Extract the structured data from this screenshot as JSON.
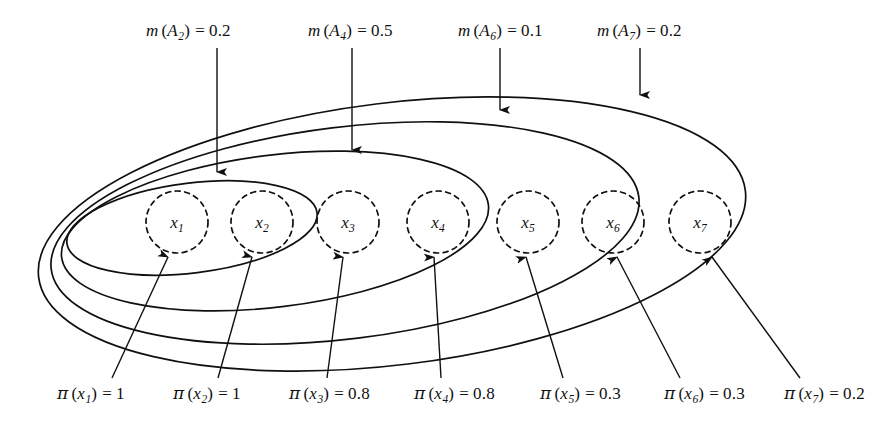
{
  "figure": {
    "type": "nested-set-venn-diagram",
    "background_color": "#ffffff",
    "stroke_color": "#101010",
    "elements": {
      "focal_sets": [
        {
          "name": "A2",
          "label_html": "A",
          "subscript": "2",
          "mass_label": "m (A2) = 0.2",
          "mass_value": "0.2",
          "contains": [
            "x1",
            "x2"
          ],
          "ellipse": {
            "cx": 192,
            "cy": 228,
            "rx": 126,
            "ry": 45,
            "rotate": -7
          }
        },
        {
          "name": "A4",
          "label_html": "A",
          "subscript": "4",
          "mass_label": "m (A4) = 0.5",
          "mass_value": "0.5",
          "contains": [
            "x1",
            "x2",
            "x3",
            "x4"
          ],
          "ellipse": {
            "cx": 275,
            "cy": 231,
            "rx": 215,
            "ry": 76,
            "rotate": -7
          }
        },
        {
          "name": "A6",
          "label_html": "A",
          "subscript": "6",
          "mass_label": "m (A6) = 0.1",
          "mass_value": "0.1",
          "contains": [
            "x1",
            "x2",
            "x3",
            "x4",
            "x5",
            "x6"
          ],
          "ellipse": {
            "cx": 345,
            "cy": 233,
            "rx": 296,
            "ry": 106,
            "rotate": -7
          }
        },
        {
          "name": "A7",
          "label_html": "A",
          "subscript": "7",
          "mass_label": "m (A7) = 0.2",
          "mass_value": "0.2",
          "contains": [
            "x1",
            "x2",
            "x3",
            "x4",
            "x5",
            "x6",
            "x7"
          ],
          "ellipse": {
            "cx": 392,
            "cy": 234,
            "rx": 356,
            "ry": 131,
            "rotate": -7
          }
        }
      ],
      "atoms": [
        {
          "name": "x1",
          "cx": 177,
          "cy": 222,
          "r": 31,
          "possibility": "1"
        },
        {
          "name": "x2",
          "cx": 262,
          "cy": 222,
          "r": 31,
          "possibility": "1"
        },
        {
          "name": "x3",
          "cx": 348,
          "cy": 222,
          "r": 31,
          "possibility": "0.8"
        },
        {
          "name": "x4",
          "cx": 438,
          "cy": 222,
          "r": 31,
          "possibility": "0.8"
        },
        {
          "name": "x5",
          "cx": 528,
          "cy": 222,
          "r": 31,
          "possibility": "0.3"
        },
        {
          "name": "x6",
          "cx": 613,
          "cy": 222,
          "r": 31,
          "possibility": "0.3"
        },
        {
          "name": "x7",
          "cx": 700,
          "cy": 222,
          "r": 31,
          "possibility": "0.2"
        }
      ]
    }
  },
  "mass_labels": [
    {
      "id": "m-A2",
      "fn": "m",
      "arg_base": "A",
      "arg_sub": "2",
      "equals": "=",
      "value": "0.2",
      "x": 146,
      "y": 21,
      "arrow": {
        "x1": 217,
        "y1": 48,
        "x2": 217,
        "y2": 172
      }
    },
    {
      "id": "m-A4",
      "fn": "m",
      "arg_base": "A",
      "arg_sub": "4",
      "equals": "=",
      "value": "0.5",
      "x": 308,
      "y": 21,
      "arrow": {
        "x1": 352,
        "y1": 48,
        "x2": 352,
        "y2": 150
      }
    },
    {
      "id": "m-A6",
      "fn": "m",
      "arg_base": "A",
      "arg_sub": "6",
      "equals": "=",
      "value": "0.1",
      "x": 458,
      "y": 21,
      "arrow": {
        "x1": 500,
        "y1": 48,
        "x2": 500,
        "y2": 110
      }
    },
    {
      "id": "m-A7",
      "fn": "m",
      "arg_base": "A",
      "arg_sub": "7",
      "equals": "=",
      "value": "0.2",
      "x": 597,
      "y": 21,
      "arrow": {
        "x1": 640,
        "y1": 48,
        "x2": 640,
        "y2": 95
      }
    }
  ],
  "possibility_labels": [
    {
      "id": "pi-x1",
      "fn": "π",
      "arg_base": "x",
      "arg_sub": "1",
      "equals": "=",
      "value": "1",
      "x": 57,
      "y": 383,
      "arrow": {
        "x1": 112,
        "y1": 378,
        "x2": 168,
        "y2": 257
      }
    },
    {
      "id": "pi-x2",
      "fn": "π",
      "arg_base": "x",
      "arg_sub": "2",
      "equals": "=",
      "value": "1",
      "x": 173,
      "y": 383,
      "arrow": {
        "x1": 218,
        "y1": 378,
        "x2": 252,
        "y2": 257
      }
    },
    {
      "id": "pi-x3",
      "fn": "π",
      "arg_base": "x",
      "arg_sub": "3",
      "equals": "=",
      "value": "0.8",
      "x": 289,
      "y": 383,
      "arrow": {
        "x1": 327,
        "y1": 378,
        "x2": 343,
        "y2": 257
      }
    },
    {
      "id": "pi-x4",
      "fn": "π",
      "arg_base": "x",
      "arg_sub": "4",
      "equals": "=",
      "value": "0.8",
      "x": 414,
      "y": 383,
      "arrow": {
        "x1": 441,
        "y1": 378,
        "x2": 434,
        "y2": 257
      }
    },
    {
      "id": "pi-x5",
      "fn": "π",
      "arg_base": "x",
      "arg_sub": "5",
      "equals": "=",
      "value": "0.3",
      "x": 540,
      "y": 383,
      "arrow": {
        "x1": 563,
        "y1": 378,
        "x2": 526,
        "y2": 257
      }
    },
    {
      "id": "pi-x6",
      "fn": "π",
      "arg_base": "x",
      "arg_sub": "6",
      "equals": "=",
      "value": "0.3",
      "x": 664,
      "y": 383,
      "arrow": {
        "x1": 680,
        "y1": 378,
        "x2": 617,
        "y2": 257
      }
    },
    {
      "id": "pi-x7",
      "fn": "π",
      "arg_base": "x",
      "arg_sub": "7",
      "equals": "=",
      "value": "0.2",
      "x": 784,
      "y": 383,
      "arrow": {
        "x1": 800,
        "y1": 378,
        "x2": 712,
        "y2": 257
      }
    }
  ]
}
